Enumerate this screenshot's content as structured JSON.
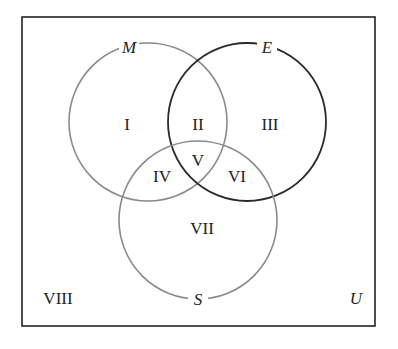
{
  "diagram": {
    "type": "venn",
    "universe_label": "U",
    "sets": [
      {
        "name": "M",
        "color": "#8a8a8a"
      },
      {
        "name": "E",
        "color": "#2a2a2a"
      },
      {
        "name": "S",
        "color": "#8a8a8a"
      }
    ],
    "regions": {
      "r1": "I",
      "r2": "II",
      "r3": "III",
      "r4": "IV",
      "r5": "V",
      "r6": "VI",
      "r7": "VII",
      "r8": "VIII"
    },
    "colors": {
      "border": "#222222",
      "background": "#ffffff",
      "text": "#222222"
    }
  }
}
